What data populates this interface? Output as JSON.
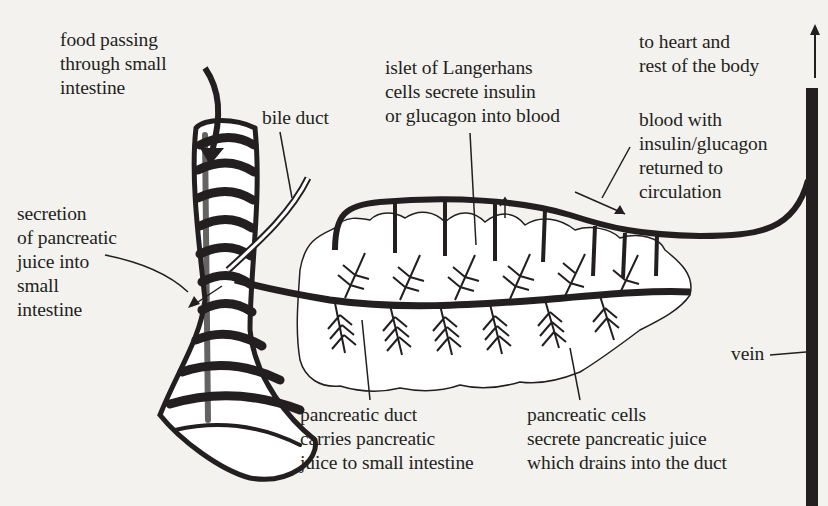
{
  "diagram": {
    "labels": {
      "food_passing": "food passing\nthrough small\nintestine",
      "bile_duct": "bile duct",
      "islet": "islet of Langerhans\ncells secrete insulin\nor glucagon into blood",
      "to_heart": "to heart and\nrest of the body",
      "blood_with": "blood with\ninsulin/glucagon\nreturned to\ncirculation",
      "secretion": "secretion\nof pancreatic\njuice into\nsmall\nintestine",
      "vein": "vein",
      "pancreatic_duct": "pancreatic duct\ncarries pancreatic\njuice to small intestine",
      "pancreatic_cells": "pancreatic cells\nsecrete pancreatic juice\nwhich drains into the duct"
    },
    "structures": [
      "small-intestine",
      "bile-duct",
      "pancreas",
      "pancreatic-duct",
      "blood-vessel",
      "vein",
      "islets-of-langerhans",
      "pancreatic-acini"
    ],
    "colors": {
      "ink": "#231f20",
      "paper": "#f3f2ef"
    }
  }
}
